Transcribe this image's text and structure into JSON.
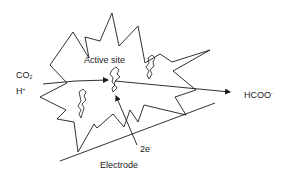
{
  "diagram": {
    "labels": {
      "active_site": "Active site",
      "reactant_co2_main": "CO",
      "reactant_co2_sub": "2",
      "reactant_h_main": "H",
      "reactant_h_sup": "+",
      "product_main": "HCOO",
      "product_sup": "-",
      "electrons_main": "2e",
      "electrons_sup": "-",
      "electrode": "Electrode"
    },
    "nodes": [
      {
        "id": "reactants",
        "label": "CO2 / H+"
      },
      {
        "id": "active_site",
        "label": "Active site"
      },
      {
        "id": "product",
        "label": "HCOO-"
      },
      {
        "id": "electrode",
        "label": "Electrode"
      }
    ],
    "edges": [
      {
        "from": "reactants",
        "to": "active_site",
        "label": ""
      },
      {
        "from": "active_site",
        "to": "product",
        "label": ""
      },
      {
        "from": "electrode",
        "to": "active_site",
        "label": "2e-"
      }
    ],
    "colors": {
      "stroke": "#1a1a1a",
      "background": "#ffffff"
    }
  }
}
